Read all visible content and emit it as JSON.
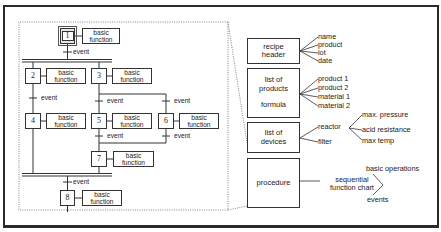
{
  "sfc": {
    "steps": [
      {
        "id": "1",
        "function": "basic\nfunction"
      },
      {
        "id": "2",
        "function": "basic\nfunction"
      },
      {
        "id": "3",
        "function": "basic\nfunction"
      },
      {
        "id": "4",
        "function": "basic\nfunction"
      },
      {
        "id": "5",
        "function": "basic\nfunction"
      },
      {
        "id": "6",
        "function": "basic\nfunction"
      },
      {
        "id": "7",
        "function": "basic\nfunction"
      },
      {
        "id": "8",
        "function": "basic\nfunction"
      }
    ],
    "basic_label": "basic",
    "function_label": "function",
    "event_label": "event"
  },
  "recipe": {
    "header": {
      "line1": "recipe",
      "line2": "header",
      "fields": [
        "name",
        "product",
        "lot",
        "date"
      ]
    },
    "products": {
      "line1": "list of",
      "line2": "products",
      "line3": "formula",
      "items": [
        "product 1",
        "product 2",
        "material 1",
        "material 2"
      ]
    },
    "devices": {
      "line1": "list of",
      "line2": "devices",
      "items": [
        "reactor",
        "filter"
      ],
      "reactor_props": [
        "max. pressure",
        "acid resistance",
        "max temp"
      ]
    },
    "procedure": {
      "label": "procedure",
      "chart_line1": "sequential",
      "chart_line2": "function chart",
      "chart_items": [
        "basic operations",
        "events"
      ]
    }
  },
  "colors": {
    "line": "#333333",
    "frame": "#2a2a2a",
    "dotted": "#666666",
    "background": "#ffffff"
  }
}
